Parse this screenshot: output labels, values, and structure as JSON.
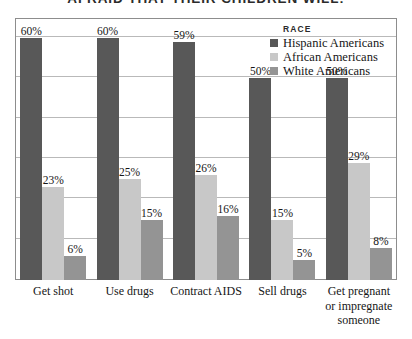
{
  "chart_data": {
    "type": "bar",
    "title": "AFRAID THAT THEIR CHILDREN WILL:",
    "xlabel": "",
    "ylabel": "",
    "ylim": [
      0,
      65
    ],
    "grid": true,
    "grid_interval": 10,
    "legend_position": "top-right",
    "legend_title": "RACE",
    "value_suffix": "%",
    "categories": [
      "Get shot",
      "Use drugs",
      "Contract AIDS",
      "Sell drugs",
      "Get pregnant or impregnate someone"
    ],
    "series": [
      {
        "name": "Hispanic Americans",
        "color": "#585858",
        "values": [
          60,
          60,
          59,
          50,
          50
        ],
        "labels": [
          "60%",
          "60%",
          "59%",
          "50%",
          "50%"
        ]
      },
      {
        "name": "African Americans",
        "color": "#c8c8c8",
        "values": [
          23,
          25,
          26,
          15,
          29
        ],
        "labels": [
          "23%",
          "25%",
          "26%",
          "15%",
          "29%"
        ]
      },
      {
        "name": "White Americans",
        "color": "#949494",
        "values": [
          6,
          15,
          16,
          5,
          8
        ],
        "labels": [
          "6%",
          "15%",
          "16%",
          "5%",
          "8%"
        ]
      }
    ]
  },
  "colors": {
    "hispanic": "#585858",
    "african": "#c8c8c8",
    "white": "#949494",
    "frame": "#8d8d8d",
    "gridline": "#b9b9b9",
    "background": "#ffffff",
    "text": "#161616"
  }
}
